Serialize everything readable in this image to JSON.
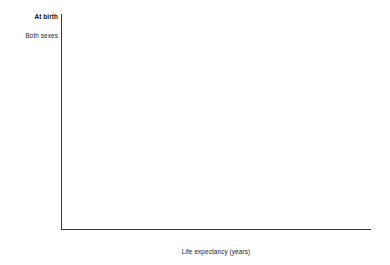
{
  "chart_data": {
    "type": "bar",
    "orientation": "horizontal",
    "title": "",
    "xlabel": "Life expectancy (years)",
    "ylabel": "",
    "xlim": [
      0,
      90
    ],
    "xticks": [
      0,
      10,
      20,
      30,
      40,
      50,
      60,
      70,
      80,
      90
    ],
    "grid": false,
    "legend_position": "right",
    "groups": [
      {
        "heading": "At birth",
        "categories": [
          "Both sexes",
          "Male",
          "Female"
        ],
        "series": [
          {
            "name": "2016",
            "color": "#585858",
            "values": [
              78.7,
              76.2,
              81.1
            ]
          },
          {
            "name": "2017",
            "color": "#b9b9b9",
            "values": [
              78.6,
              76.1,
              81.1
            ]
          }
        ]
      },
      {
        "heading": "At age 65",
        "categories": [
          "Both sexes",
          "Male",
          "Female"
        ],
        "series": [
          {
            "name": "2016",
            "color": "#585858",
            "values": [
              19.4,
              18.1,
              20.6
            ]
          },
          {
            "name": "2017",
            "color": "#b9b9b9",
            "values": [
              19.5,
              18.1,
              20.6
            ]
          }
        ]
      }
    ],
    "legend": [
      {
        "name": "2016",
        "color": "#585858"
      },
      {
        "name": "2017",
        "color": "#b9b9b9"
      }
    ]
  }
}
